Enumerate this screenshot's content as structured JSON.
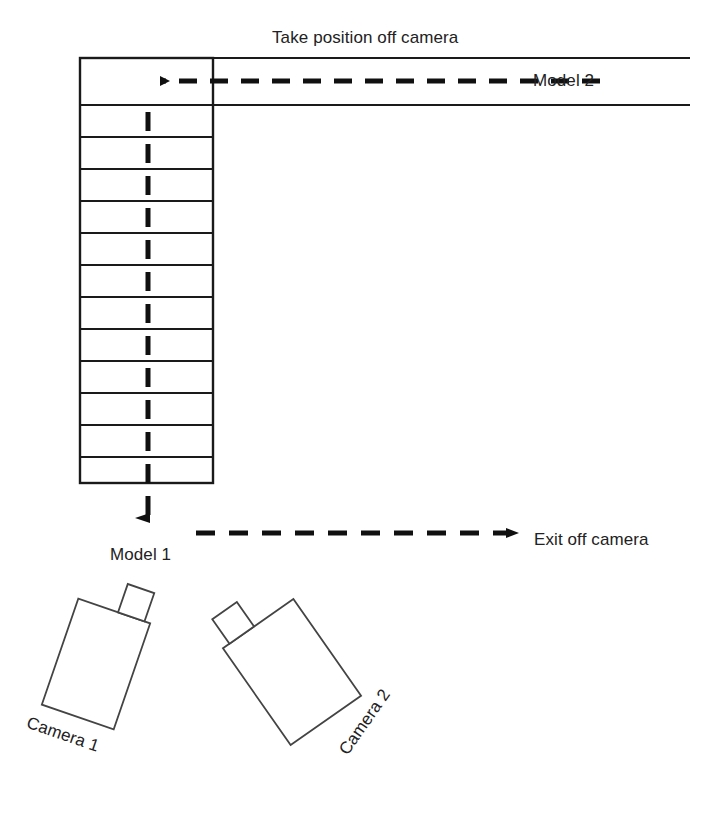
{
  "diagram": {
    "background_color": "#ffffff",
    "line_color": "#1a1a1a",
    "labels": {
      "take_position": "Take position off camera",
      "model_2": "Model 2",
      "exit_off_camera": "Exit off camera",
      "model_1": "Model 1",
      "camera_1": "Camera 1",
      "camera_2": "Camera 2"
    },
    "runway": {
      "x": 80,
      "y": 58,
      "width": 133,
      "height": 425,
      "segment_count": 13,
      "rung_lines_y": [
        105,
        137,
        169,
        201,
        233,
        265,
        297,
        329,
        361,
        393,
        425,
        457
      ],
      "center_x": 148
    },
    "cross_band": {
      "top_y": 58,
      "bottom_y": 105,
      "right_x": 690
    },
    "arrows": {
      "model_2_path": {
        "name": "model-2-entrance-arrow",
        "direction": "left",
        "style": "dashed",
        "from_x": 600,
        "to_x": 148,
        "y": 81
      },
      "model_1_path": {
        "name": "model-1-walk-arrow",
        "direction": "down",
        "style": "dashed",
        "x": 148,
        "from_y": 112,
        "to_y": 535
      },
      "exit_path": {
        "name": "exit-arrow",
        "direction": "right",
        "style": "dashed",
        "from_x": 196,
        "to_x": 522,
        "y": 533
      }
    },
    "cameras": [
      {
        "name": "camera-1",
        "label": "Camera 1",
        "body": {
          "cx": 96,
          "cy": 664,
          "width": 76,
          "height": 112,
          "rotation_deg": 19
        },
        "viewfinder": {
          "width": 28,
          "height": 30
        }
      },
      {
        "name": "camera-2",
        "label": "Camera 2",
        "body": {
          "cx": 292,
          "cy": 672,
          "width": 86,
          "height": 118,
          "rotation_deg": -35
        },
        "viewfinder": {
          "width": 30,
          "height": 30
        }
      }
    ]
  }
}
